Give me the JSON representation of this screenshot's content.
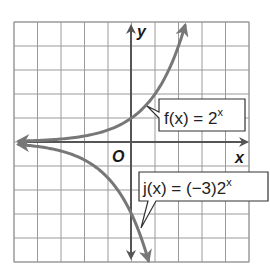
{
  "chart_data": {
    "type": "line",
    "title": "",
    "xlabel": "x",
    "ylabel": "y",
    "origin_label": "O",
    "xlim": [
      -5,
      5
    ],
    "ylim": [
      -5,
      5
    ],
    "grid": true,
    "grid_step": 1,
    "tick_labels": false,
    "series": [
      {
        "name": "f(x) = 2^x",
        "label_text": "f(x) = 2",
        "label_exponent": "x",
        "formula": "2^x",
        "color": "#777777",
        "x": [
          -5,
          -4,
          -3,
          -2,
          -1,
          0,
          1,
          2,
          2.32
        ],
        "y": [
          0.03,
          0.06,
          0.13,
          0.25,
          0.5,
          1,
          2,
          4,
          5
        ]
      },
      {
        "name": "j(x) = (-3)2^x",
        "label_text": "j(x) = (−3)2",
        "label_exponent": "x",
        "formula": "-3*2^x",
        "color": "#777777",
        "x": [
          -5,
          -4,
          -3,
          -2,
          -1,
          0,
          0.5,
          0.74
        ],
        "y": [
          -0.09,
          -0.19,
          -0.38,
          -0.75,
          -1.5,
          -3,
          -4.24,
          -5
        ]
      }
    ],
    "annotations": [
      {
        "text": "f(x) = 2^x",
        "points_to": [
          0.4,
          1.5
        ]
      },
      {
        "text": "j(x) = (-3)2^x",
        "points_to": [
          0.4,
          -3.6
        ]
      }
    ]
  },
  "colors": {
    "grid": "#9a9a9a",
    "axis": "#555555",
    "curve": "#777777",
    "text": "#222222"
  }
}
